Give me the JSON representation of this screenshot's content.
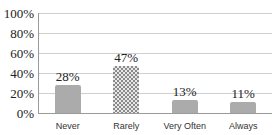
{
  "chart_data": {
    "type": "bar",
    "title": "",
    "xlabel": "",
    "ylabel": "",
    "categories": [
      "Never",
      "Rarely",
      "Very Often",
      "Always"
    ],
    "values": [
      28,
      47,
      13,
      11
    ],
    "data_labels": [
      "28%",
      "47%",
      "13%",
      "11%"
    ],
    "ylim": [
      0,
      100
    ],
    "yticks": [
      "0%",
      "20%",
      "40%",
      "60%",
      "80%",
      "100%"
    ],
    "grid": true,
    "legend": "none",
    "bar_styles": [
      "solid-gray",
      "checkered",
      "solid-gray",
      "solid-gray"
    ],
    "colors": {
      "bar": "#ababab",
      "grid": "#cfcfcf",
      "axis": "#9a9a9a"
    }
  }
}
